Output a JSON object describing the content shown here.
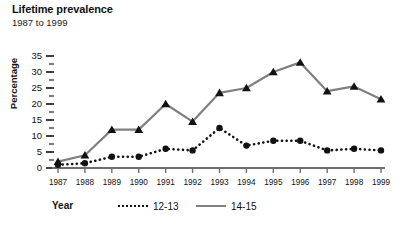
{
  "chart": {
    "title": "Lifetime prevalence",
    "subtitle": "1987 to 1999",
    "ylabel": "Percentage",
    "xlabel": "Year"
  },
  "legend": {
    "title": "Year",
    "entries": [
      {
        "label": "12-13",
        "style": "dotted",
        "color": "#111111"
      },
      {
        "label": "14-15",
        "style": "solid",
        "color": "#808080"
      }
    ]
  },
  "chart_data": {
    "type": "line",
    "title": "Lifetime prevalence",
    "subtitle": "1987 to 1999",
    "xlabel": "Year",
    "ylabel": "Percentage",
    "ylim": [
      0,
      35
    ],
    "ytick_step": 5,
    "yminor_step": 2.5,
    "grid": false,
    "legend_position": "bottom",
    "categories": [
      "1987",
      "1988",
      "1989",
      "1990",
      "1991",
      "1992",
      "1993",
      "1994",
      "1995",
      "1996",
      "1997",
      "1998",
      "1999"
    ],
    "yticks": [
      0,
      5,
      10,
      15,
      20,
      25,
      30,
      35
    ],
    "series": [
      {
        "name": "12-13",
        "color": "#111111",
        "line_style": "dotted",
        "marker": "circle",
        "values": [
          1,
          1.5,
          3.5,
          3.5,
          6,
          5.5,
          12.5,
          7,
          8.5,
          8.5,
          5.5,
          6,
          5.5
        ]
      },
      {
        "name": "14-15",
        "color": "#808080",
        "line_style": "solid",
        "marker": "triangle",
        "values": [
          2,
          4,
          12,
          12,
          20,
          14.5,
          23.5,
          25,
          30,
          33,
          24,
          25.5,
          21.5
        ]
      }
    ]
  }
}
